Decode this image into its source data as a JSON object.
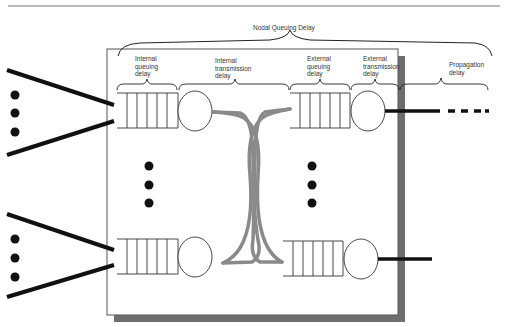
{
  "figure": {
    "caption_fragment": "",
    "colors": {
      "line": "#111111",
      "box_border": "#555555",
      "shadow": "#6e6e6e",
      "switch_fabric": "#8a8a8a",
      "text": "#333333",
      "rule": "#777777"
    }
  },
  "labels": {
    "nodal_queuing_delay": "Nodal Queuing Delay",
    "internal_queuing_delay": [
      "Internal",
      "queuing",
      "delay"
    ],
    "internal_transmission_delay": [
      "Internal",
      "transmission",
      "delay"
    ],
    "external_queuing_delay": [
      "External",
      "queuing",
      "delay"
    ],
    "external_transmission_delay": [
      "External",
      "transmission",
      "delay"
    ],
    "propagation_delay": [
      "Propagation",
      "delay"
    ]
  },
  "components": {
    "input_ports": 2,
    "queues_per_side": 2,
    "queue_slots": 6,
    "ellipsis_dots": 3
  }
}
